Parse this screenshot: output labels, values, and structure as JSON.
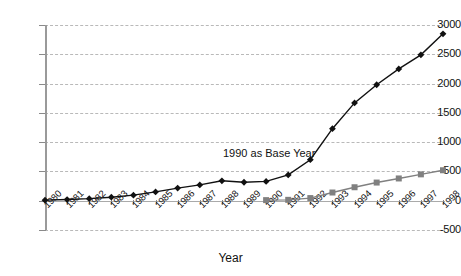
{
  "chart_data": {
    "type": "line",
    "title": "",
    "xlabel": "Year",
    "ylabel": "",
    "grid": true,
    "legend": "none",
    "annotations": [
      {
        "text": "1990 as Base Year",
        "x": "1991",
        "y": 900
      }
    ],
    "categories": [
      "1980",
      "1981",
      "1982",
      "1983",
      "1984",
      "1985",
      "1986",
      "1987",
      "1988",
      "1989",
      "1990",
      "1991",
      "1992",
      "1993",
      "1994",
      "1995",
      "1996",
      "1997",
      "1998"
    ],
    "ylim": [
      -500,
      3000
    ],
    "yticks": [
      -500,
      0,
      500,
      1000,
      1500,
      2000,
      2500,
      3000
    ],
    "ytick_labels": [
      "-500",
      "0",
      "500",
      "1000",
      "1500",
      "2000",
      "2500",
      "3000"
    ],
    "series": [
      {
        "name": "series-diamond",
        "marker": "diamond",
        "color": "#111111",
        "values": [
          10,
          20,
          35,
          60,
          95,
          150,
          215,
          270,
          340,
          315,
          330,
          440,
          700,
          1230,
          1670,
          1980,
          2250,
          2490,
          2850
        ]
      },
      {
        "name": "series-square",
        "marker": "square",
        "color": "#808080",
        "values": [
          null,
          null,
          null,
          null,
          null,
          null,
          null,
          null,
          null,
          null,
          10,
          15,
          45,
          140,
          230,
          310,
          380,
          450,
          520
        ]
      }
    ]
  },
  "axis": {
    "x_title": "Year"
  },
  "colors": {
    "background": "#ffffff",
    "grid": "#b9b9b9",
    "axis": "#9a9a9a",
    "diamond_series": "#111111",
    "square_series": "#808080",
    "text": "#111111"
  }
}
